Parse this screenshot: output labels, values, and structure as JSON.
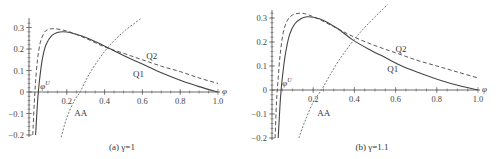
{
  "chart_data": [
    {
      "type": "line",
      "panel": "a",
      "caption": "(a) γ=1",
      "xlabel": "φ",
      "ylabel": "",
      "xlim": [
        0,
        1.0
      ],
      "ylim": [
        -0.2,
        0.33
      ],
      "xticks": [
        0.2,
        0.4,
        0.6,
        0.8,
        1.0
      ],
      "xtick_labels": [
        "0.2",
        "0.4",
        "0.6",
        "0.8",
        "1.0"
      ],
      "yticks": [
        0.3,
        0.2,
        0.1,
        0,
        -0.1,
        -0.2
      ],
      "ytick_labels": [
        "0.3",
        "0.2",
        "0.1",
        "0",
        "−0.1",
        "−0.2"
      ],
      "grid": false,
      "annotations": [
        {
          "text": "φ",
          "sup": "U",
          "x": 0.06,
          "y": 0.015
        },
        {
          "text": "Q2",
          "x": 0.62,
          "y": 0.155
        },
        {
          "text": "Q1",
          "x": 0.55,
          "y": 0.07
        },
        {
          "text": "AA",
          "x": 0.24,
          "y": -0.11
        }
      ],
      "series": [
        {
          "name": "Q1",
          "style": "solid",
          "x": [
            0.035,
            0.045,
            0.055,
            0.07,
            0.09,
            0.12,
            0.15,
            0.18,
            0.22,
            0.28,
            0.35,
            0.42,
            0.5,
            0.6,
            0.7,
            0.8,
            0.9,
            1.0
          ],
          "y": [
            -0.2,
            -0.05,
            0.05,
            0.15,
            0.22,
            0.262,
            0.277,
            0.28,
            0.276,
            0.26,
            0.235,
            0.205,
            0.17,
            0.13,
            0.09,
            0.055,
            0.025,
            0.0
          ]
        },
        {
          "name": "Q2",
          "style": "dashed",
          "x": [
            0.02,
            0.028,
            0.035,
            0.045,
            0.06,
            0.08,
            0.1,
            0.13,
            0.17,
            0.22,
            0.3,
            0.4,
            0.5,
            0.6,
            0.7,
            0.8,
            0.9,
            1.0
          ],
          "y": [
            -0.2,
            -0.05,
            0.05,
            0.15,
            0.23,
            0.275,
            0.29,
            0.295,
            0.29,
            0.278,
            0.25,
            0.21,
            0.18,
            0.15,
            0.12,
            0.095,
            0.065,
            0.04
          ]
        },
        {
          "name": "AA",
          "style": "dash-dot",
          "x": [
            0.17,
            0.2,
            0.24,
            0.27,
            0.31,
            0.36,
            0.42,
            0.5,
            0.59
          ],
          "y": [
            -0.21,
            -0.12,
            -0.04,
            0.0,
            0.07,
            0.14,
            0.21,
            0.28,
            0.34
          ]
        }
      ]
    },
    {
      "type": "line",
      "panel": "b",
      "caption": "(b) γ=1.1",
      "xlabel": "φ",
      "ylabel": "",
      "xlim": [
        0,
        1.0
      ],
      "ylim": [
        -0.2,
        0.35
      ],
      "xticks": [
        0.2,
        0.4,
        0.6,
        0.8,
        1.0
      ],
      "xtick_labels": [
        "0.2",
        "0.4",
        "0.6",
        "0.8",
        "1.0"
      ],
      "yticks": [
        0.3,
        0.2,
        0.1,
        0,
        -0.1,
        -0.2
      ],
      "ytick_labels": [
        "0.3",
        "0.2",
        "0.1",
        "0",
        "−0.1",
        "−0.2"
      ],
      "grid": false,
      "annotations": [
        {
          "text": "φ",
          "sup": "U",
          "x": 0.05,
          "y": 0.015
        },
        {
          "text": "Q2",
          "x": 0.6,
          "y": 0.16
        },
        {
          "text": "Q1",
          "x": 0.56,
          "y": 0.075
        },
        {
          "text": "AA",
          "x": 0.22,
          "y": -0.11
        }
      ],
      "series": [
        {
          "name": "Q1",
          "style": "solid",
          "x": [
            0.03,
            0.04,
            0.05,
            0.065,
            0.085,
            0.11,
            0.14,
            0.17,
            0.2,
            0.25,
            0.32,
            0.39,
            0.47,
            0.55,
            0.63,
            0.72,
            0.82,
            0.91,
            1.0
          ],
          "y": [
            -0.2,
            -0.05,
            0.05,
            0.15,
            0.23,
            0.275,
            0.297,
            0.305,
            0.303,
            0.29,
            0.255,
            0.21,
            0.17,
            0.135,
            0.1,
            0.07,
            0.04,
            0.018,
            0.0
          ]
        },
        {
          "name": "Q2",
          "style": "dashed",
          "x": [
            0.015,
            0.022,
            0.03,
            0.04,
            0.055,
            0.075,
            0.1,
            0.14,
            0.18,
            0.24,
            0.32,
            0.4,
            0.5,
            0.6,
            0.7,
            0.8,
            0.9,
            1.0
          ],
          "y": [
            -0.2,
            -0.05,
            0.05,
            0.15,
            0.24,
            0.29,
            0.313,
            0.32,
            0.312,
            0.29,
            0.255,
            0.22,
            0.185,
            0.155,
            0.125,
            0.1,
            0.075,
            0.05
          ]
        },
        {
          "name": "AA",
          "style": "dash-dot",
          "x": [
            0.13,
            0.16,
            0.2,
            0.24,
            0.28,
            0.33,
            0.39,
            0.46,
            0.56
          ],
          "y": [
            -0.2,
            -0.13,
            -0.05,
            0.0,
            0.06,
            0.13,
            0.2,
            0.27,
            0.355
          ]
        }
      ]
    }
  ],
  "panels": [
    {
      "caption": "(a) γ=1",
      "axis_var": "φ",
      "phi_u_label": "φ",
      "phi_u_sup": "U",
      "labels": {
        "q1": "Q1",
        "q2": "Q2",
        "aa": "AA"
      }
    },
    {
      "caption": "(b) γ=1.1",
      "axis_var": "φ",
      "phi_u_label": "φ",
      "phi_u_sup": "U",
      "labels": {
        "q1": "Q1",
        "q2": "Q2",
        "aa": "AA"
      }
    }
  ],
  "layout": [
    {
      "x0": 29,
      "x1": 218,
      "y0": 92,
      "ypu": 215,
      "top": 18,
      "bottom": 137,
      "cap_x": 122,
      "cap_y": 150
    },
    {
      "x0": 272,
      "x1": 478,
      "y0": 90,
      "ypu": 240,
      "top": 10,
      "bottom": 140,
      "cap_x": 372,
      "cap_y": 150
    }
  ]
}
